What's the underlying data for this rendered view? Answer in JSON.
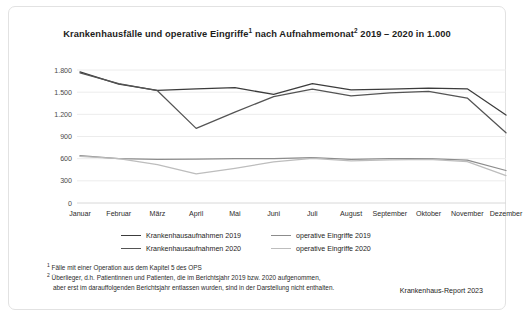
{
  "card": {
    "title_main": "Krankenhausfälle und operative Eingriffe",
    "title_sup1": "1",
    "title_mid": " nach Aufnahmemonat",
    "title_sup2": "2",
    "title_end": " 2019 – 2020 in 1.000"
  },
  "chart_data": {
    "type": "line",
    "xlabel": "",
    "ylabel": "",
    "ylim": [
      0,
      1800
    ],
    "yticks": [
      0,
      300,
      600,
      900,
      1200,
      1500,
      1800
    ],
    "ytick_labels": [
      "0",
      "300",
      "600",
      "900",
      "1.200",
      "1.500",
      "1.800"
    ],
    "grid": true,
    "legend_position": "bottom",
    "categories": [
      "Januar",
      "Februar",
      "März",
      "April",
      "Mai",
      "Juni",
      "Juli",
      "August",
      "September",
      "Oktober",
      "November",
      "Dezember"
    ],
    "series": [
      {
        "name": "Krankenhausaufnahmen 2019",
        "color": "#3c3c3c",
        "values": [
          1775,
          1610,
          1525,
          1545,
          1560,
          1470,
          1615,
          1530,
          1540,
          1555,
          1545,
          1190
        ]
      },
      {
        "name": "Krankenhausaufnahmen 2020",
        "color": "#545454",
        "values": [
          1760,
          1615,
          1520,
          1010,
          1230,
          1440,
          1540,
          1450,
          1490,
          1510,
          1420,
          950
        ]
      },
      {
        "name": "operative Eingriffe 2019",
        "color": "#8c8c8c",
        "values": [
          640,
          600,
          590,
          595,
          600,
          600,
          615,
          590,
          600,
          600,
          580,
          440
        ]
      },
      {
        "name": "operative Eingriffe 2020",
        "color": "#bdbdbd",
        "values": [
          630,
          600,
          520,
          395,
          470,
          555,
          605,
          570,
          585,
          590,
          560,
          370
        ]
      }
    ]
  },
  "legend": {
    "items": [
      {
        "label": "Krankenhausaufnahmen 2019",
        "color": "#3c3c3c"
      },
      {
        "label": "operative Eingriffe 2019",
        "color": "#8c8c8c"
      },
      {
        "label": "Krankenhausaufnahmen 2020",
        "color": "#545454"
      },
      {
        "label": "operative Eingriffe 2020",
        "color": "#bdbdbd"
      }
    ]
  },
  "footnotes": {
    "n1_marker": "1",
    "n1_text": " Fälle mit einer Operation aus dem Kapitel 5 des OPS",
    "n2_marker": "2",
    "n2_text": " Überlieger, d.h. Patientinnen und Patienten, die im Berichtsjahr 2019 bzw. 2020 aufgenommen,",
    "n2_text_cont": "aber erst im darauffolgenden Berichtsjahr entlassen wurden, sind in der Darstellung nicht enthalten."
  },
  "credit": "Krankenhaus-Report 2023"
}
